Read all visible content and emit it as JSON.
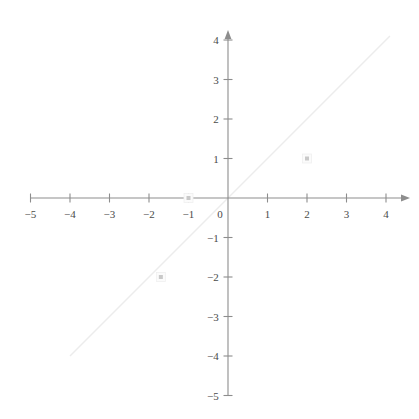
{
  "chart_data": {
    "type": "scatter",
    "title": "",
    "subtitle": "",
    "xlabel": "",
    "ylabel": "",
    "xlim": [
      -5.6,
      4.8
    ],
    "ylim": [
      -5.4,
      4.9
    ],
    "grid": false,
    "legend": null,
    "legend_position": "none",
    "axis_style": "cartesian-crosshair-arrows",
    "x_ticks": [
      -5,
      -4,
      -3,
      -2,
      -1,
      0,
      1,
      2,
      3,
      4
    ],
    "x_tick_labels": [
      "−5",
      "−4",
      "−3",
      "−2",
      "−1",
      "0",
      "1",
      "2",
      "3",
      "4"
    ],
    "y_ticks": [
      4,
      3,
      2,
      1,
      -1,
      -2,
      -3,
      -4,
      -5
    ],
    "y_tick_labels": [
      "4",
      "3",
      "2",
      "1",
      "−1",
      "−2",
      "−3",
      "−4",
      "−5"
    ],
    "origin_label": "0",
    "series": [
      {
        "name": "points",
        "marker": "square",
        "color": "#c9c9c9",
        "points": [
          {
            "x": 2,
            "y": 1
          },
          {
            "x": -1,
            "y": 0
          },
          {
            "x": -1.7,
            "y": -2
          }
        ]
      },
      {
        "name": "identity-line",
        "type": "line",
        "equation": "y = x",
        "color": "#ececec",
        "x_start": -4.0,
        "y_start": -4.0,
        "x_end": 4.1,
        "y_end": 4.1
      }
    ],
    "axis_color": "#8d8d8d",
    "tick_color": "#8d8d8d",
    "label_color": "#4a4a4a",
    "background_color": "#ffffff"
  },
  "figure": {
    "name": "coordinate-plane"
  }
}
